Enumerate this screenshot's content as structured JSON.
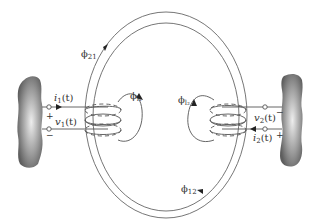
{
  "diagram": {
    "type": "mutual-inductance coupled coils",
    "labels": {
      "phi21": {
        "symbol": "ϕ",
        "sub": "21"
      },
      "phi12": {
        "symbol": "ϕ",
        "sub": "12"
      },
      "phi_l1": {
        "symbol": "ϕ",
        "sub": "l₁"
      },
      "phi_l2": {
        "symbol": "ϕ",
        "sub": "l₂"
      },
      "i1": {
        "name": "i",
        "sub": "1",
        "arg": "(t)"
      },
      "v1": {
        "name": "v",
        "sub": "1",
        "arg": "(t)"
      },
      "i2": {
        "name": "i",
        "sub": "2",
        "arg": "(t)"
      },
      "v2": {
        "name": "v",
        "sub": "2",
        "arg": "(t)"
      }
    },
    "polarity": {
      "left_plus": "+",
      "left_minus": "−",
      "right_plus": "+",
      "right_minus": "−"
    },
    "colors": {
      "line": "#555555",
      "core": "#666666",
      "blob_dark": "#6a6a6a",
      "blob_light": "#e8e8e8"
    }
  }
}
